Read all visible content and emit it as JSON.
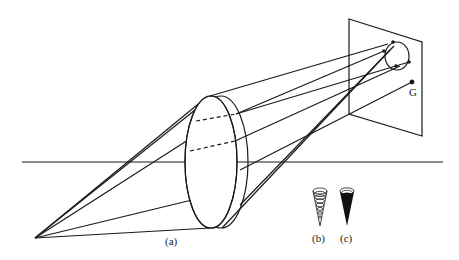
{
  "figure": {
    "labels": {
      "a": "(a)",
      "b": "(b)",
      "c": "(c)",
      "point_G": "G"
    },
    "colors": {
      "stroke": "#1a1a1a",
      "background": "#ffffff"
    },
    "elements": {
      "light_source": "point source (lower left)",
      "lens": "converging lens (ellipse with thickness)",
      "screen": "image plane (parallelogram)",
      "image_circle": "circle of confusion on screen",
      "horizon": "optical axis line",
      "cone_b": "concentric-ring cone icon",
      "cone_c": "solid black cone icon"
    }
  }
}
